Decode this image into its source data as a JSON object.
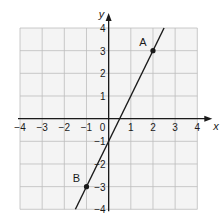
{
  "chart_data": {
    "type": "line",
    "title": "",
    "xlabel": "x",
    "ylabel": "y",
    "xlim": [
      -4,
      4
    ],
    "ylim": [
      -4,
      4
    ],
    "grid": true,
    "x_ticks": [
      -4,
      -3,
      -2,
      -1,
      0,
      1,
      2,
      3,
      4
    ],
    "y_ticks": [
      -4,
      -3,
      -2,
      -1,
      1,
      2,
      3,
      4
    ],
    "x_tick_labels": [
      "−4",
      "−3",
      "−2",
      "−1",
      "0",
      "1",
      "2",
      "3",
      "4"
    ],
    "y_tick_labels": [
      "−4",
      "−3",
      "−2",
      "−1",
      "1",
      "2",
      "3",
      "4"
    ],
    "series": [
      {
        "name": "line AB",
        "equation": "y = 2x − 1",
        "x": [
          -1.5,
          2.5
        ],
        "y": [
          -4,
          4
        ]
      }
    ],
    "points": [
      {
        "label": "A",
        "x": 2,
        "y": 3
      },
      {
        "label": "B",
        "x": -1,
        "y": -3
      }
    ]
  },
  "colors": {
    "grid": "#bdbdbd",
    "grid_bg": "#f4f4f4",
    "axis": "#1a1a1a",
    "line": "#1a1a1a"
  }
}
